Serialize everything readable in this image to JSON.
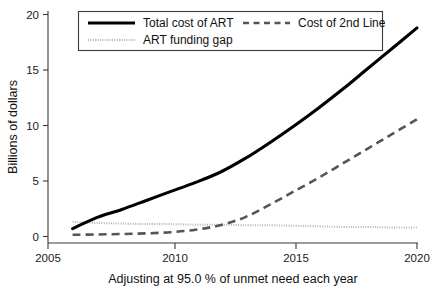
{
  "chart_data": {
    "type": "line",
    "title": "",
    "xlabel": "Adjusting at 95.0 % of unmet need each year",
    "ylabel": "Billions of dollars",
    "xlim": [
      2005,
      2020
    ],
    "ylim": [
      0,
      20
    ],
    "xticks": [
      2005,
      2010,
      2015,
      2020
    ],
    "xticklabels": [
      "2005",
      "2010",
      "2015",
      "2020"
    ],
    "yticks": [
      0,
      5,
      10,
      15,
      20
    ],
    "yticklabels": [
      "0",
      "5",
      "10",
      "15",
      "20"
    ],
    "grid": false,
    "legend_position": "upper-left-inside",
    "x": [
      2006,
      2007,
      2008,
      2009,
      2010,
      2011,
      2012,
      2013,
      2014,
      2015,
      2016,
      2017,
      2018,
      2019,
      2020
    ],
    "series": [
      {
        "name": "Total cost of ART",
        "style": "solid",
        "color": "#000000",
        "values": [
          0.7,
          1.7,
          2.4,
          3.2,
          4.0,
          4.8,
          5.7,
          6.9,
          8.3,
          9.8,
          11.4,
          13.1,
          14.9,
          16.7,
          18.5
        ]
      },
      {
        "name": "Cost of 2nd Line",
        "style": "dashed",
        "color": "#555555",
        "values": [
          0.15,
          0.18,
          0.22,
          0.28,
          0.38,
          0.6,
          1.0,
          1.7,
          2.8,
          4.0,
          5.2,
          6.5,
          7.8,
          9.1,
          10.4
        ]
      },
      {
        "name": "ART funding gap",
        "style": "dotted",
        "color": "#b3b3b3",
        "values": [
          1.3,
          1.2,
          1.15,
          1.1,
          1.1,
          1.05,
          1.05,
          1.0,
          1.0,
          0.95,
          0.9,
          0.85,
          0.85,
          0.8,
          0.8
        ]
      }
    ]
  },
  "legend": {
    "entries": [
      {
        "label": "Total cost of ART"
      },
      {
        "label": "Cost of 2nd Line"
      },
      {
        "label": "ART funding gap"
      }
    ]
  },
  "axes": {
    "y_title": "Billions of dollars",
    "x_title": "Adjusting at 95.0 % of unmet need each year",
    "y_tick_0": "0",
    "y_tick_1": "5",
    "y_tick_2": "10",
    "y_tick_3": "15",
    "y_tick_4": "20",
    "x_tick_0": "2005",
    "x_tick_1": "2010",
    "x_tick_2": "2015",
    "x_tick_3": "2020"
  },
  "colors": {
    "total": "#000000",
    "second_line": "#555555",
    "funding_gap": "#b3b3b3",
    "axis": "#3a3a3a",
    "background": "#ffffff"
  }
}
